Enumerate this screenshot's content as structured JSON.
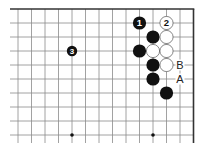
{
  "diagram": {
    "type": "go-board-fragment",
    "grid": {
      "columns": 14,
      "rows": 10,
      "x0": 18,
      "y0": 9,
      "col_spacing": 13.5,
      "row_spacing": 14,
      "line_color": "#8a8a8a",
      "edge_color": "#333333",
      "edges": [
        "top",
        "right"
      ],
      "line_extend_left": 10,
      "line_extend_bottom": 143
    },
    "star_points": [
      {
        "col": 4,
        "row": 9
      },
      {
        "col": 10,
        "row": 9
      }
    ],
    "stones": [
      {
        "color": "black",
        "col": 9,
        "row": 1,
        "label": "1"
      },
      {
        "color": "white",
        "col": 11,
        "row": 1,
        "label": "2"
      },
      {
        "color": "black",
        "col": 10,
        "row": 2,
        "label": ""
      },
      {
        "color": "white",
        "col": 11,
        "row": 2,
        "label": ""
      },
      {
        "color": "black",
        "col": 9,
        "row": 3,
        "label": ""
      },
      {
        "color": "white",
        "col": 10,
        "row": 3,
        "label": ""
      },
      {
        "color": "white",
        "col": 11,
        "row": 3,
        "label": ""
      },
      {
        "color": "black",
        "col": 4,
        "row": 3,
        "label": "3",
        "small": true
      },
      {
        "color": "black",
        "col": 10,
        "row": 4,
        "label": ""
      },
      {
        "color": "white",
        "col": 11,
        "row": 4,
        "label": ""
      },
      {
        "color": "black",
        "col": 10,
        "row": 5,
        "label": ""
      },
      {
        "color": "black",
        "col": 11,
        "row": 6,
        "label": ""
      }
    ],
    "point_labels": [
      {
        "col": 12,
        "row": 4,
        "text": "B"
      },
      {
        "col": 12,
        "row": 5,
        "text": "A"
      }
    ],
    "colors": {
      "black_stone": "#111111",
      "white_stone": "#ffffff",
      "white_stone_border": "#555555",
      "background": "#ffffff",
      "label_on_black": "#ffffff",
      "label_on_white": "#111111",
      "point_label": "#222222"
    }
  }
}
